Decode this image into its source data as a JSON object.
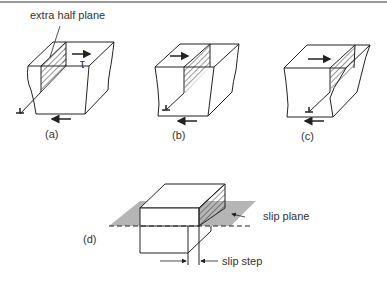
{
  "figure": {
    "annotations": {
      "extra_half_plane": "extra half plane",
      "tau": "τ",
      "slip_plane": "slip plane",
      "slip_step": "slip step"
    },
    "panels": [
      {
        "id": "a",
        "label": "(a)",
        "description": "Edge dislocation with extra half plane at left of crystal under shear stress τ"
      },
      {
        "id": "b",
        "label": "(b)",
        "description": "Dislocation moved to middle of crystal"
      },
      {
        "id": "c",
        "label": "(c)",
        "description": "Dislocation near right edge of crystal"
      },
      {
        "id": "d",
        "label": "(d)",
        "description": "Dislocation exited crystal producing slip step on slip plane"
      }
    ],
    "colors": {
      "line": "#222222",
      "hatch": "#333333",
      "slip_plane_fill": "#b5b5b5",
      "border": "#9a9a9a"
    }
  }
}
